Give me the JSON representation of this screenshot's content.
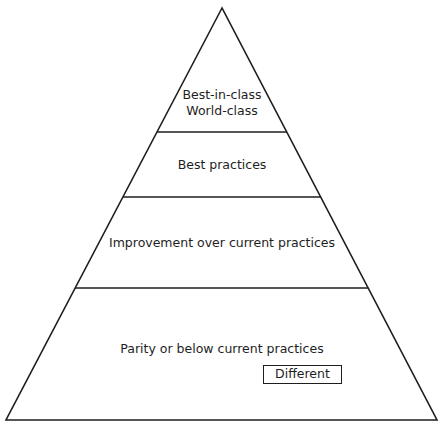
{
  "diagram": {
    "type": "pyramid",
    "line_color": "#1e1e1e",
    "background": "#ffffff",
    "levels": [
      {
        "position": "top",
        "lines": [
          "Best-in-class",
          "World-class"
        ]
      },
      {
        "position": "second",
        "label": "Best practices"
      },
      {
        "position": "third",
        "label": "Improvement over current practices"
      },
      {
        "position": "base",
        "label": "Parity or below current practices",
        "tag": "Different"
      }
    ]
  }
}
